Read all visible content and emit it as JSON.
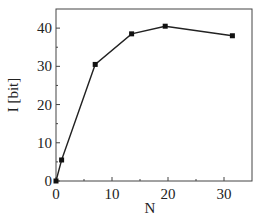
{
  "chart_data": {
    "type": "line",
    "title": "",
    "xlabel": "N",
    "ylabel": "I [bit]",
    "xlim": [
      0,
      35
    ],
    "ylim": [
      0,
      45
    ],
    "xticks": [
      0,
      10,
      20,
      30
    ],
    "yticks": [
      0,
      10,
      20,
      30,
      40
    ],
    "x": [
      0,
      1,
      7,
      13.5,
      19.5,
      31.5
    ],
    "values": [
      0,
      5.5,
      30.5,
      38.5,
      40.5,
      38
    ],
    "grid": false,
    "legend": null
  }
}
